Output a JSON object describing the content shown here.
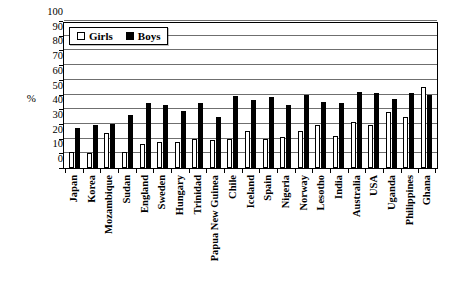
{
  "chart_data": {
    "type": "bar",
    "title": "",
    "xlabel": "",
    "ylabel": "%",
    "ylim": [
      0,
      100
    ],
    "ytick_step": 10,
    "grid": true,
    "legend_position": "top-left",
    "categories": [
      "Japan",
      "Korea",
      "Mozambique",
      "Sudan",
      "England",
      "Sweden",
      "Hungary",
      "Trinidad",
      "Papua New Guinea",
      "Chile",
      "Iceland",
      "Spain",
      "Nigeria",
      "Norway",
      "Lesotho",
      "India",
      "Australia",
      "USA",
      "Uganda",
      "Philippines",
      "Ghana"
    ],
    "series": [
      {
        "name": "Girls",
        "values": [
          11,
          10,
          24,
          11,
          16,
          18,
          18,
          20,
          19,
          20,
          25,
          20,
          21,
          25,
          29,
          22,
          31,
          29,
          38,
          35,
          55
        ]
      },
      {
        "name": "Boys",
        "values": [
          27,
          29,
          30,
          36,
          44,
          43,
          39,
          44,
          35,
          49,
          46,
          48,
          43,
          50,
          45,
          44,
          52,
          51,
          47,
          51,
          50
        ]
      }
    ],
    "ytick_labels": [
      "100",
      "90",
      "80",
      "70",
      "60",
      "50",
      "40",
      "30",
      "20",
      "10",
      "0"
    ]
  },
  "legend": {
    "items": [
      {
        "label": "Girls",
        "swatch": "open-square",
        "color": "#ffffff"
      },
      {
        "label": "Boys",
        "swatch": "filled-square",
        "color": "#000000"
      }
    ]
  },
  "axis": {
    "y_unit_label": "%"
  },
  "colors": {
    "girls": "#ffffff",
    "boys": "#000000",
    "axis": "#000000",
    "grid": "#6f6f6f",
    "background": "#ffffff"
  }
}
